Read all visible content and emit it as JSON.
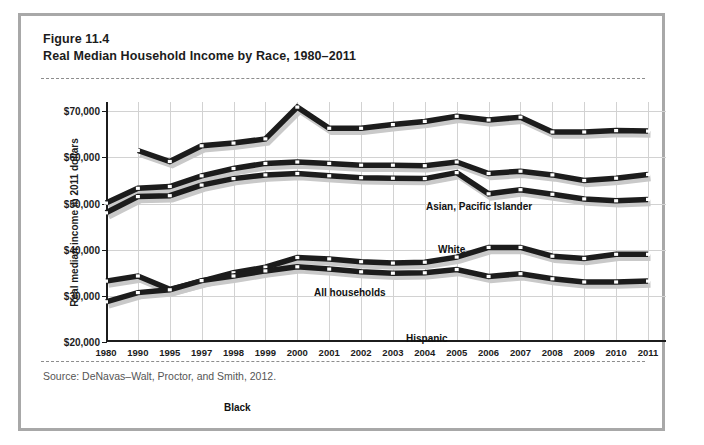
{
  "figure": {
    "number": "Figure 11.4",
    "title": "Real Median Household Income by Race, 1980–2011",
    "source": "Source: DeNavas–Walt, Proctor, and Smith, 2012."
  },
  "colors": {
    "frame_border": "#a8a8a8",
    "line": "#1c1c1c",
    "shadow": "#c9c9c9",
    "marker_fill": "#ffffff",
    "gridline": "#d2d2d2",
    "dashed_rule": "#8d8d8d",
    "text": "#1c1c1c",
    "source_text": "#555555"
  },
  "chart_data": {
    "type": "line",
    "title": "Real Median Household Income by Race, 1980–2011",
    "xlabel": "",
    "ylabel": "Real median income in 2011 dollars",
    "ylim": [
      20000,
      72000
    ],
    "ytick_values": [
      20000,
      30000,
      40000,
      50000,
      60000,
      70000
    ],
    "ytick_labels": [
      "$20,000",
      "$30,000",
      "$40,000",
      "$50,000",
      "$60,000",
      "$70,000"
    ],
    "grid": true,
    "legend_position": "inline-labels",
    "categories": [
      "1980",
      "1990",
      "1995",
      "1997",
      "1998",
      "1999",
      "2000",
      "2001",
      "2002",
      "2003",
      "2004",
      "2005",
      "2006",
      "2007",
      "2008",
      "2009",
      "2010",
      "2011"
    ],
    "series": [
      {
        "name": "Asian, Pacific Islander",
        "label": "Asian, Pacific Islander",
        "values": [
          null,
          61500,
          59100,
          62500,
          63100,
          64000,
          70900,
          66300,
          66300,
          67100,
          67800,
          68900,
          68100,
          68700,
          65500,
          65500,
          65800,
          65700
        ]
      },
      {
        "name": "White",
        "label": "White",
        "values": [
          50100,
          53300,
          53700,
          56000,
          57600,
          58700,
          59000,
          58700,
          58300,
          58300,
          58200,
          59000,
          56500,
          57000,
          56200,
          55000,
          55500,
          56300
        ]
      },
      {
        "name": "All households",
        "label": "All households",
        "values": [
          48000,
          51500,
          51700,
          54000,
          55400,
          56200,
          56500,
          56000,
          55600,
          55500,
          55400,
          56700,
          52100,
          53000,
          52000,
          51000,
          50600,
          50900
        ]
      },
      {
        "name": "Hispanic",
        "label": "Hispanic",
        "values": [
          33200,
          34300,
          31400,
          33200,
          35000,
          36200,
          38300,
          38000,
          37400,
          37100,
          37300,
          38400,
          40500,
          40500,
          38600,
          38100,
          39000,
          39000
        ]
      },
      {
        "name": "Black",
        "label": "Black",
        "values": [
          28700,
          30700,
          31300,
          33300,
          34300,
          35400,
          36300,
          35800,
          35200,
          34900,
          35000,
          35700,
          34200,
          34800,
          33700,
          33000,
          33000,
          33200
        ]
      }
    ],
    "annotations": [
      {
        "text": "Asian, Pacific Islander",
        "attached_series": "Asian, Pacific Islander"
      },
      {
        "text": "White",
        "attached_series": "White"
      },
      {
        "text": "All households",
        "attached_series": "All households"
      },
      {
        "text": "Hispanic",
        "attached_series": "Hispanic"
      },
      {
        "text": "Black",
        "attached_series": "Black"
      }
    ]
  },
  "series_label_positions": [
    {
      "name": "asian-pacific-islander",
      "left": 320,
      "top": 99
    },
    {
      "name": "white",
      "left": 332,
      "top": 142
    },
    {
      "name": "all-households",
      "left": 208,
      "top": 185
    },
    {
      "name": "hispanic",
      "left": 300,
      "top": 231
    },
    {
      "name": "black",
      "left": 118,
      "top": 300
    }
  ]
}
